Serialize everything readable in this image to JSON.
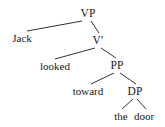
{
  "figure": {
    "type": "syntax-tree",
    "sentence": "Jack looked toward the door",
    "background_color": "#ffffff",
    "line_color": "#1a1a1a",
    "text_color": "#1a1a1a"
  },
  "nodes": {
    "vp": {
      "label": "VP",
      "x": 88,
      "y": 13
    },
    "jack": {
      "label": "Jack",
      "x": 22,
      "y": 38
    },
    "vbar": {
      "label": "V'",
      "x": 98,
      "y": 40
    },
    "looked": {
      "label": "looked",
      "x": 55,
      "y": 66
    },
    "pp": {
      "label": "PP",
      "x": 117,
      "y": 65
    },
    "toward": {
      "label": "toward",
      "x": 88,
      "y": 91
    },
    "dp": {
      "label": "DP",
      "x": 135,
      "y": 91
    },
    "the": {
      "label": "the",
      "x": 121,
      "y": 116
    },
    "door": {
      "label": "door",
      "x": 144,
      "y": 116
    }
  },
  "branches": [
    {
      "name": "vp-to-jack",
      "x1": 82,
      "y1": 21,
      "x2": 27,
      "y2": 31
    },
    {
      "name": "vp-to-vbar",
      "x1": 91,
      "y1": 21,
      "x2": 99,
      "y2": 33
    },
    {
      "name": "vbar-to-looked",
      "x1": 95,
      "y1": 48,
      "x2": 55,
      "y2": 59
    },
    {
      "name": "vbar-to-pp",
      "x1": 101,
      "y1": 48,
      "x2": 116,
      "y2": 58
    },
    {
      "name": "pp-to-toward",
      "x1": 114,
      "y1": 73,
      "x2": 91,
      "y2": 84
    },
    {
      "name": "pp-to-dp",
      "x1": 120,
      "y1": 73,
      "x2": 136,
      "y2": 84
    },
    {
      "name": "dp-to-the",
      "x1": 133,
      "y1": 99,
      "x2": 122,
      "y2": 109
    },
    {
      "name": "dp-to-door",
      "x1": 137,
      "y1": 99,
      "x2": 146,
      "y2": 109
    }
  ]
}
